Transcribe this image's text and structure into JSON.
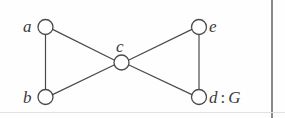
{
  "figure": {
    "kind": "undirected-graph-diagram",
    "name_label": "G",
    "separator": ":",
    "background_color": "#fefefe",
    "edge_color": "#4a4a4a",
    "node_stroke_color": "#4a4a4a",
    "node_fill_color": "#ffffff",
    "text_color": "#3a3a3a",
    "rule_color": "#8a8a8a"
  },
  "nodes": [
    {
      "id": "a",
      "label": "a",
      "cx": 45.5,
      "cy": 27,
      "r": 7.5,
      "label_pos": "left"
    },
    {
      "id": "b",
      "label": "b",
      "cx": 45.5,
      "cy": 97,
      "r": 7.5,
      "label_pos": "left"
    },
    {
      "id": "c",
      "label": "c",
      "cx": 121.5,
      "cy": 62.5,
      "r": 7.5,
      "label_pos": "above"
    },
    {
      "id": "e",
      "label": "e",
      "cx": 199,
      "cy": 27,
      "r": 7.5,
      "label_pos": "right"
    },
    {
      "id": "d",
      "label": "d",
      "cx": 199,
      "cy": 97,
      "r": 7.5,
      "label_pos": "right"
    }
  ],
  "edges": [
    {
      "from": "a",
      "to": "b",
      "x1": 45.5,
      "y1": 34.5,
      "x2": 45.5,
      "y2": 89.5
    },
    {
      "from": "a",
      "to": "c",
      "x1": 52.6,
      "y1": 29.4,
      "x2": 114.6,
      "y2": 60.2
    },
    {
      "from": "b",
      "to": "c",
      "x1": 52.6,
      "y1": 94.6,
      "x2": 114.6,
      "y2": 64.8
    },
    {
      "from": "c",
      "to": "e",
      "x1": 128.4,
      "y1": 60.2,
      "x2": 191.9,
      "y2": 29.4
    },
    {
      "from": "c",
      "to": "d",
      "x1": 128.4,
      "y1": 64.8,
      "x2": 191.9,
      "y2": 94.6
    },
    {
      "from": "e",
      "to": "d",
      "x1": 199,
      "y1": 34.5,
      "x2": 199,
      "y2": 89.5
    }
  ],
  "rules": {
    "right_vertical_x": 271,
    "bottom_horizontal_y": 112
  }
}
